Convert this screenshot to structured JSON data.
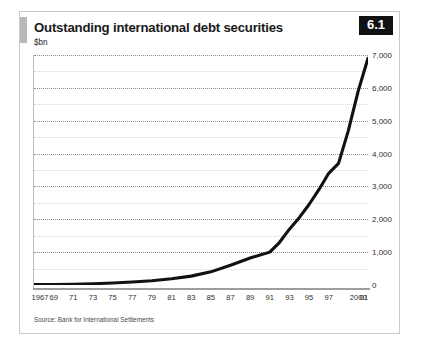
{
  "card": {
    "title": "Outstanding international debt securities",
    "subtitle": "$bn",
    "badge": "6.1",
    "source": "Source: Bank for International Settlements",
    "accent_color": "#111111",
    "line_color": "#111111",
    "grid_color": "#8e8e8e",
    "border_color": "#c9c9c9"
  },
  "chart_data": {
    "type": "line",
    "title": "Outstanding international debt securities",
    "subtitle": "$bn",
    "xlabel": "",
    "ylabel": "$bn",
    "ylim": [
      0,
      7000
    ],
    "xlim": [
      1967,
      2001
    ],
    "grid": true,
    "legend": false,
    "y_ticks": [
      0,
      1000,
      2000,
      3000,
      4000,
      5000,
      6000,
      7000
    ],
    "y_tick_labels": [
      "0",
      "1,000",
      "2,000",
      "3,000",
      "4,000",
      "5,000",
      "6,000",
      "7,000"
    ],
    "y_minor_ticks": [
      500,
      1500,
      2500,
      3500,
      4500,
      5500,
      6500
    ],
    "x_tick_labels": [
      "1967",
      "69",
      "71",
      "73",
      "75",
      "77",
      "79",
      "81",
      "83",
      "85",
      "87",
      "89",
      "91",
      "93",
      "95",
      "97",
      "2000",
      "01"
    ],
    "x_tick_values": [
      1967,
      1969,
      1971,
      1973,
      1975,
      1977,
      1979,
      1981,
      1983,
      1985,
      1987,
      1989,
      1991,
      1993,
      1995,
      1997,
      2000,
      2001
    ],
    "series": [
      {
        "name": "Outstanding international debt securities",
        "x": [
          1967,
          1969,
          1971,
          1973,
          1975,
          1977,
          1979,
          1981,
          1983,
          1985,
          1987,
          1989,
          1991,
          1992,
          1993,
          1994,
          1995,
          1996,
          1997,
          1998,
          1999,
          2000,
          2001
        ],
        "values": [
          10,
          15,
          25,
          40,
          60,
          90,
          130,
          190,
          270,
          400,
          600,
          820,
          1000,
          1300,
          1700,
          2050,
          2450,
          2900,
          3400,
          3700,
          4700,
          5900,
          6900
        ]
      }
    ]
  }
}
